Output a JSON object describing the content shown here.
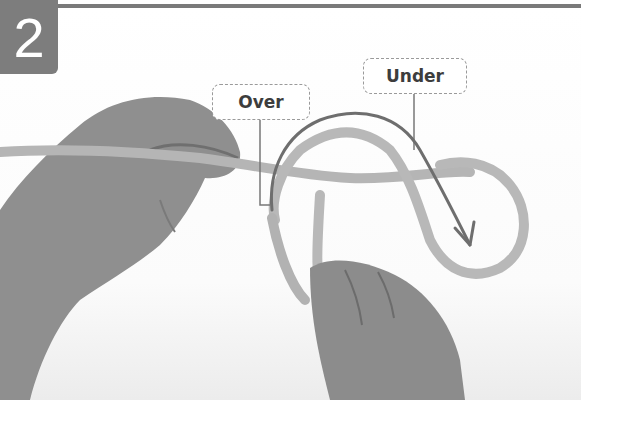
{
  "step": {
    "number": "2"
  },
  "callouts": {
    "over": "Over",
    "under": "Under"
  },
  "icons": {
    "next": "double-chevron-right-icon"
  },
  "colors": {
    "badge": "#7d7d7d",
    "rule": "#7a7a7a",
    "rope": "#b5b5b5",
    "arrow": "#6e6e6e",
    "hand": "#8e8e8e",
    "callout_border": "#9a9a9a",
    "text": "#3d3d3d"
  }
}
